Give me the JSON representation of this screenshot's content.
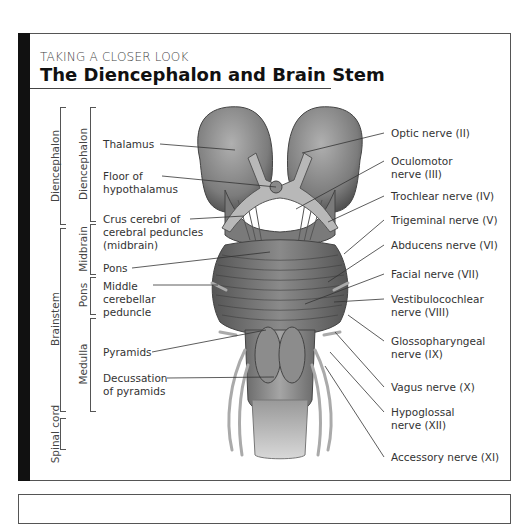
{
  "header": {
    "kicker": "TAKING A CLOSER LOOK",
    "title": "The Diencephalon and Brain Stem"
  },
  "brackets": {
    "outer": [
      {
        "label": "Diencephalon"
      },
      {
        "label": "Brainstem"
      },
      {
        "label": "Spinal cord"
      }
    ],
    "inner": [
      {
        "label": "Diencephalon"
      },
      {
        "label": "Midbrain"
      },
      {
        "label": "Pons"
      },
      {
        "label": "Medulla"
      }
    ]
  },
  "left_labels": [
    {
      "line1": "Thalamus"
    },
    {
      "line1": "Floor of",
      "line2": "hypothalamus"
    },
    {
      "line1": "Crus cerebri of",
      "line2": "cerebral peduncles",
      "line3": "(midbrain)"
    },
    {
      "line1": "Pons"
    },
    {
      "line1": "Middle",
      "line2": "cerebellar",
      "line3": "peduncle"
    },
    {
      "line1": "Pyramids"
    },
    {
      "line1": "Decussation",
      "line2": "of pyramids"
    }
  ],
  "right_labels": [
    {
      "line1": "Optic nerve (II)"
    },
    {
      "line1": "Oculomotor",
      "line2": "nerve (III)"
    },
    {
      "line1": "Trochlear nerve (IV)"
    },
    {
      "line1": "Trigeminal nerve (V)"
    },
    {
      "line1": "Abducens nerve (VI)"
    },
    {
      "line1": "Facial nerve (VII)"
    },
    {
      "line1": "Vestibulocochlear",
      "line2": "nerve (VIII)"
    },
    {
      "line1": "Glossopharyngeal",
      "line2": "nerve (IX)"
    },
    {
      "line1": "Vagus nerve (X)"
    },
    {
      "line1": "Hypoglossal",
      "line2": "nerve (XII)"
    },
    {
      "line1": "Accessory nerve (XI)"
    }
  ],
  "colors": {
    "frame_bar": "#111111",
    "frame_border": "#555555",
    "illustration_tone": "#7a7a7a"
  }
}
